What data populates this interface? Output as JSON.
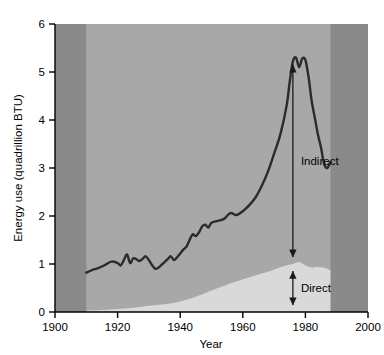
{
  "chart_data": {
    "type": "area",
    "title": "",
    "subtitle": "",
    "xlabel": "Year",
    "ylabel": "Energy use (quadrillion BTU)",
    "xlim": [
      1900,
      2000
    ],
    "ylim": [
      0,
      6
    ],
    "xticks": [
      1900,
      1920,
      1940,
      1960,
      1980,
      2000
    ],
    "xtick_labels": [
      "1900",
      "1920",
      "1940",
      "1960",
      "1980",
      "2000"
    ],
    "yticks": [
      0,
      1,
      2,
      3,
      4,
      5,
      6
    ],
    "ytick_labels": [
      "0",
      "1",
      "2",
      "3",
      "4",
      "5",
      "6"
    ],
    "grid": false,
    "legend_position": "inline-annotations",
    "data_start_year": 1910,
    "data_end_year": 1988,
    "annotations": [
      {
        "label": "Indirect",
        "year": 1976,
        "value_from": 1.0,
        "value_to": 5.3,
        "arrow": "double-headed-vertical"
      },
      {
        "label": "Direct",
        "year": 1976,
        "value_from": 0.0,
        "value_to": 1.0,
        "arrow": "double-headed-vertical"
      }
    ],
    "series": [
      {
        "name": "Direct",
        "kind": "area",
        "color": "#d9d9d9",
        "x": [
          1910,
          1915,
          1920,
          1925,
          1930,
          1935,
          1940,
          1945,
          1950,
          1955,
          1960,
          1963,
          1966,
          1969,
          1972,
          1975,
          1976,
          1978,
          1980,
          1982,
          1984,
          1986,
          1988
        ],
        "values": [
          0.03,
          0.04,
          0.06,
          0.09,
          0.13,
          0.16,
          0.22,
          0.32,
          0.45,
          0.57,
          0.68,
          0.74,
          0.8,
          0.86,
          0.93,
          0.99,
          1.0,
          1.04,
          0.97,
          0.93,
          0.94,
          0.92,
          0.87
        ]
      },
      {
        "name": "Total (Direct + Indirect)",
        "kind": "line",
        "color": "#2b2b2b",
        "x": [
          1910,
          1912,
          1914,
          1916,
          1918,
          1920,
          1921,
          1922,
          1923,
          1924,
          1925,
          1926,
          1927,
          1928,
          1929,
          1930,
          1931,
          1932,
          1933,
          1934,
          1935,
          1936,
          1937,
          1938,
          1939,
          1940,
          1941,
          1942,
          1943,
          1944,
          1945,
          1946,
          1947,
          1948,
          1949,
          1950,
          1952,
          1954,
          1956,
          1958,
          1960,
          1962,
          1964,
          1966,
          1968,
          1970,
          1972,
          1974,
          1975,
          1976,
          1977,
          1978,
          1979,
          1980,
          1981,
          1982,
          1983,
          1984,
          1985,
          1986,
          1987,
          1988
        ],
        "values": [
          0.82,
          0.88,
          0.92,
          0.98,
          1.05,
          1.02,
          0.97,
          1.08,
          1.2,
          1.02,
          1.12,
          1.1,
          1.06,
          1.11,
          1.16,
          1.08,
          0.98,
          0.9,
          0.92,
          0.98,
          1.04,
          1.1,
          1.16,
          1.08,
          1.14,
          1.22,
          1.3,
          1.36,
          1.5,
          1.62,
          1.58,
          1.66,
          1.78,
          1.82,
          1.76,
          1.86,
          1.9,
          1.94,
          2.06,
          2.02,
          2.1,
          2.22,
          2.38,
          2.62,
          2.92,
          3.3,
          3.7,
          4.3,
          4.8,
          5.22,
          5.3,
          5.1,
          5.28,
          5.25,
          4.9,
          4.4,
          4.05,
          3.7,
          3.42,
          3.08,
          3.0,
          3.12
        ]
      }
    ],
    "colors": {
      "plot_background": "#a8a8a8",
      "margin_background": "#8a8a8a",
      "direct_band": "#d9d9d9",
      "total_line": "#2b2b2b",
      "axis": "#000000",
      "text": "#000000",
      "figure_background": "#ffffff"
    }
  }
}
